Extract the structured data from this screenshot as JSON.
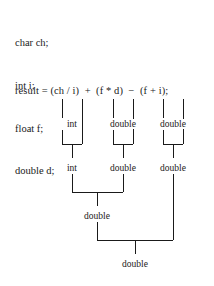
{
  "figure": {
    "background_color": "#ffffff",
    "ink_color": "#1a1a1a",
    "kind": "type-promotion-tree"
  },
  "declarations": {
    "lines": [
      "char ch;",
      "int i;",
      "float f;",
      "double d;"
    ]
  },
  "expression": {
    "text": "result = (ch / i)  +  (f * d)  −  (f + i);"
  },
  "tree": {
    "levels": [
      {
        "name": "operand-types",
        "labels": [
          "int",
          "double",
          "double"
        ]
      },
      {
        "name": "subexpression-types",
        "labels": [
          "int",
          "double",
          "double"
        ]
      },
      {
        "name": "combined-type",
        "labels": [
          "double"
        ]
      },
      {
        "name": "result-type",
        "labels": [
          "double"
        ]
      }
    ],
    "nodes": [
      {
        "id": "l1-n1",
        "label": "int",
        "x": 72,
        "y": 124
      },
      {
        "id": "l1-n2",
        "label": "double",
        "x": 123,
        "y": 124
      },
      {
        "id": "l1-n3",
        "label": "double",
        "x": 173,
        "y": 124
      },
      {
        "id": "l2-n1",
        "label": "int",
        "x": 97,
        "y": 168
      },
      {
        "id": "l2-n2",
        "label": "double",
        "x": 148,
        "y": 168
      },
      {
        "id": "l2-n3",
        "label": "double",
        "x": 190,
        "y": 168
      },
      {
        "id": "l3-n1",
        "label": "double",
        "x": 122,
        "y": 216
      },
      {
        "id": "l4-n1",
        "label": "double",
        "x": 160,
        "y": 264
      }
    ]
  }
}
